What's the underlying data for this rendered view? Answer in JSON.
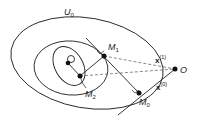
{
  "diagram": {
    "labels": {
      "region": {
        "main": "U",
        "sub": "0"
      },
      "m1": {
        "main": "M",
        "sub": "1"
      },
      "m2": {
        "main": "M",
        "sub": "2"
      },
      "m0": {
        "main": "M",
        "sub": "0"
      },
      "origin": "O",
      "x1": {
        "main": "x",
        "sup": "(1)"
      },
      "x0": {
        "main": "x",
        "sup": "(0)"
      }
    },
    "colors": {
      "stroke": "#222222",
      "dashed": "#555555"
    }
  }
}
